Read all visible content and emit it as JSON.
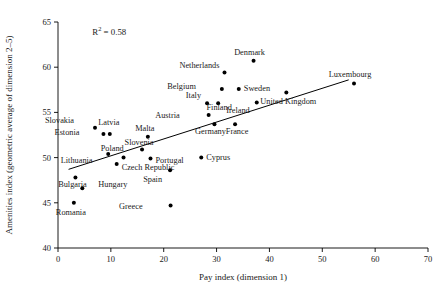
{
  "chart_data": {
    "type": "scatter",
    "title": "",
    "xlabel": "Pay index (dimension 1)",
    "ylabel": "Amenities index (geometric average of dimension 2–5)",
    "xlim": [
      0,
      70
    ],
    "ylim": [
      40,
      65
    ],
    "xticks": [
      0,
      10,
      20,
      30,
      40,
      50,
      60,
      70
    ],
    "yticks": [
      40,
      45,
      50,
      55,
      60,
      65
    ],
    "xtick_labels": [
      "0",
      "10",
      "20",
      "30",
      "40",
      "50",
      "60",
      "70"
    ],
    "ytick_labels": [
      "40",
      "45",
      "50",
      "55",
      "60",
      "65"
    ],
    "grid": false,
    "legend": false,
    "annotations": [
      {
        "name": "r-squared",
        "text": "R² = 0.58",
        "x": 6.5,
        "y": 63.6
      }
    ],
    "trendline": {
      "name": "linear-fit",
      "x0": 2.0,
      "y0": 48.7,
      "x1": 55.0,
      "y1": 58.6,
      "r_squared": 0.58
    },
    "points": [
      {
        "label": "Slovakia",
        "x": 7.0,
        "y": 53.3,
        "label_dx": -21,
        "label_dy": -5
      },
      {
        "label": "Latvia",
        "x": 9.8,
        "y": 52.6,
        "label_dx": -1,
        "label_dy": -9
      },
      {
        "label": "Estonia",
        "x": 8.6,
        "y": 52.6,
        "label_dx": -24,
        "label_dy": 1
      },
      {
        "label": "Poland",
        "x": 9.5,
        "y": 50.4,
        "label_dx": 4,
        "label_dy": -3
      },
      {
        "label": "Lithuania",
        "x": 12.4,
        "y": 50.0,
        "label_dx": -31,
        "label_dy": 5
      },
      {
        "label": "Czech Republic",
        "x": 11.1,
        "y": 49.3,
        "label_dx": 5,
        "label_dy": 6
      },
      {
        "label": "Bulgaria",
        "x": 3.3,
        "y": 47.8,
        "label_dx": -3,
        "label_dy": 10
      },
      {
        "label": "Hungary",
        "x": 4.6,
        "y": 46.6,
        "label_dx": 16,
        "label_dy": -1
      },
      {
        "label": "Romania",
        "x": 3.0,
        "y": 45.0,
        "label_dx": -3,
        "label_dy": 12
      },
      {
        "label": "Slovenia",
        "x": 15.9,
        "y": 50.9,
        "label_dx": -3,
        "label_dy": -4
      },
      {
        "label": "Malta",
        "x": 17.0,
        "y": 52.3,
        "label_dx": -3,
        "label_dy": -6
      },
      {
        "label": "Portugal",
        "x": 17.5,
        "y": 49.9,
        "label_dx": 5,
        "label_dy": 4
      },
      {
        "label": "Greece",
        "x": 21.3,
        "y": 44.7,
        "label_dx": -28,
        "label_dy": 3
      },
      {
        "label": "Spain",
        "x": 21.2,
        "y": 48.6,
        "label_dx": -8,
        "label_dy": 12
      },
      {
        "label": "Cyprus",
        "x": 27.1,
        "y": 50.0,
        "label_dx": 5,
        "label_dy": 2
      },
      {
        "label": "Italy",
        "x": 28.2,
        "y": 56.0,
        "label_dx": -6,
        "label_dy": -5
      },
      {
        "label": "Austria",
        "x": 28.5,
        "y": 54.7,
        "label_dx": -29,
        "label_dy": 3
      },
      {
        "label": "Germany",
        "x": 29.6,
        "y": 53.7,
        "label_dx": -4,
        "label_dy": 10
      },
      {
        "label": "Finland",
        "x": 30.3,
        "y": 56.0,
        "label_dx": 1,
        "label_dy": 7
      },
      {
        "label": "Belgium",
        "x": 31.0,
        "y": 57.6,
        "label_dx": -26,
        "label_dy": 0
      },
      {
        "label": "Netherlands",
        "x": 31.5,
        "y": 59.4,
        "label_dx": -5,
        "label_dy": -5
      },
      {
        "label": "France",
        "x": 33.5,
        "y": 53.7,
        "label_dx": 2,
        "label_dy": 10
      },
      {
        "label": "Sweden",
        "x": 34.2,
        "y": 57.6,
        "label_dx": 5,
        "label_dy": 2
      },
      {
        "label": "Denmark",
        "x": 37.0,
        "y": 60.7,
        "label_dx": -4,
        "label_dy": -6
      },
      {
        "label": "Ireland",
        "x": 37.6,
        "y": 56.1,
        "label_dx": -7,
        "label_dy": 11
      },
      {
        "label": "United Kingdom",
        "x": 43.2,
        "y": 57.2,
        "label_dx": 2,
        "label_dy": 11
      },
      {
        "label": "Luxembourg",
        "x": 56.0,
        "y": 58.2,
        "label_dx": -4,
        "label_dy": -6
      }
    ]
  }
}
